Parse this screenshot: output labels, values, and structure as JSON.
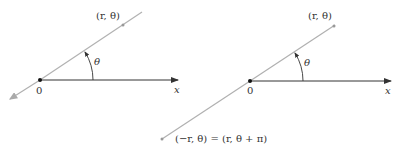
{
  "left_diagram": {
    "point_label": "(r, θ)",
    "angle_label": "θ",
    "origin_label": "0",
    "axis_label": "x"
  },
  "right_diagram": {
    "point_label": "(r, θ)",
    "angle_label": "θ",
    "origin_label": "0",
    "axis_label": "x",
    "negative_point_label": "(−r, θ) = (r, θ + π)"
  },
  "colors": {
    "ray": "#b0b0b0",
    "axis": "#333333",
    "point": "#999999"
  }
}
